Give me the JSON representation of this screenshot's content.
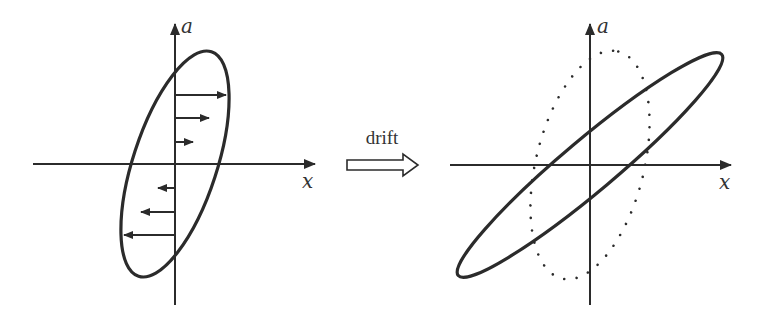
{
  "colors": {
    "ink": "#2b2b2b",
    "label": "#333333",
    "background": "#ffffff"
  },
  "left_panel": {
    "name": "initial-phase-space",
    "x_axis_label": "x",
    "y_axis_label": "a",
    "ellipse": {
      "cx": 175,
      "cy": 164,
      "rx": 118,
      "ry": 42,
      "rotation_deg": -72
    },
    "velocity_arrows": [
      {
        "y": 95,
        "x_tip": 226,
        "direction": "right"
      },
      {
        "y": 118,
        "x_tip": 209,
        "direction": "right"
      },
      {
        "y": 142,
        "x_tip": 193,
        "direction": "right"
      },
      {
        "y": 188,
        "x_tip": 158,
        "direction": "left"
      },
      {
        "y": 212,
        "x_tip": 141,
        "direction": "left"
      },
      {
        "y": 235,
        "x_tip": 124,
        "direction": "left"
      }
    ]
  },
  "transition": {
    "label": "drift",
    "arrow_style": "hollow-right-arrow"
  },
  "right_panel": {
    "name": "drifted-phase-space",
    "x_axis_label": "x",
    "y_axis_label": "a",
    "solid_ellipse": {
      "cx": 590,
      "cy": 165,
      "rx": 172,
      "ry": 26,
      "rotation_deg": -40
    },
    "dotted_ellipse": {
      "cx": 590,
      "cy": 165,
      "rx": 117,
      "ry": 54,
      "rotation_deg": -76,
      "style": "dotted"
    }
  }
}
